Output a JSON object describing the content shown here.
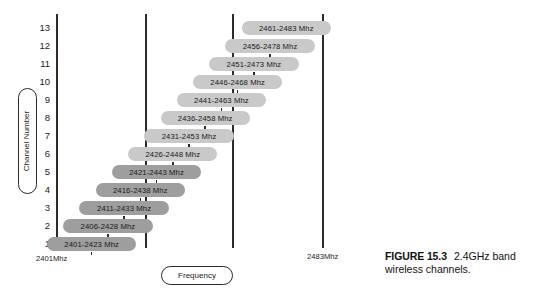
{
  "figure": {
    "number_label": "FIGURE 15.3",
    "caption_text": "2.4GHz band wireless channels."
  },
  "axes": {
    "y_axis_label": "Channel Number",
    "x_axis_label": "Frequency",
    "x_start_label": "2401Mhz",
    "x_end_label": "2483Mhz"
  },
  "chart_data": {
    "type": "bar",
    "orientation": "horizontal",
    "title": "2.4GHz band wireless channels",
    "xlabel": "Frequency",
    "ylabel": "Channel Number",
    "xlim": [
      2401,
      2483
    ],
    "x_tick_labels": [
      "2401Mhz",
      "2483Mhz"
    ],
    "grid": false,
    "categories": [
      "1",
      "2",
      "3",
      "4",
      "5",
      "6",
      "7",
      "8",
      "9",
      "10",
      "11",
      "12",
      "13"
    ],
    "reference_lines": [
      2412,
      2437,
      2462
    ],
    "series": [
      {
        "name": "Channel band (Mhz)",
        "values": [
          {
            "channel": "1",
            "label": "2401-2423 Mhz",
            "start": 2401,
            "end": 2423,
            "center": 2412,
            "shade": "dark"
          },
          {
            "channel": "2",
            "label": "2406-2428 Mhz",
            "start": 2406,
            "end": 2428,
            "center": 2417,
            "shade": "dark"
          },
          {
            "channel": "3",
            "label": "2411-2433 Mhz",
            "start": 2411,
            "end": 2433,
            "center": 2422,
            "shade": "dark"
          },
          {
            "channel": "4",
            "label": "2416-2438 Mhz",
            "start": 2416,
            "end": 2438,
            "center": 2427,
            "shade": "dark"
          },
          {
            "channel": "5",
            "label": "2421-2443 Mhz",
            "start": 2421,
            "end": 2443,
            "center": 2432,
            "shade": "dark"
          },
          {
            "channel": "6",
            "label": "2426-2448 Mhz",
            "start": 2426,
            "end": 2448,
            "center": 2437,
            "shade": "light"
          },
          {
            "channel": "7",
            "label": "2431-2453 Mhz",
            "start": 2431,
            "end": 2453,
            "center": 2442,
            "shade": "light"
          },
          {
            "channel": "8",
            "label": "2436-2458 Mhz",
            "start": 2436,
            "end": 2458,
            "center": 2447,
            "shade": "light"
          },
          {
            "channel": "9",
            "label": "2441-2463 Mhz",
            "start": 2441,
            "end": 2463,
            "center": 2452,
            "shade": "light"
          },
          {
            "channel": "10",
            "label": "2446-2468 Mhz",
            "start": 2446,
            "end": 2468,
            "center": 2457,
            "shade": "light"
          },
          {
            "channel": "11",
            "label": "2451-2473 Mhz",
            "start": 2451,
            "end": 2473,
            "center": 2462,
            "shade": "light"
          },
          {
            "channel": "12",
            "label": "2456-2478 Mhz",
            "start": 2456,
            "end": 2478,
            "center": 2467,
            "shade": "light"
          },
          {
            "channel": "13",
            "label": "2461-2483 Mhz",
            "start": 2461,
            "end": 2483,
            "center": 2472,
            "shade": "light"
          }
        ]
      }
    ]
  },
  "colors": {
    "band_light": "#c9c9c9",
    "band_dark": "#9e9e9e",
    "axis": "#2b2b2b",
    "text": "#1a1a1a",
    "background": "#ffffff"
  }
}
